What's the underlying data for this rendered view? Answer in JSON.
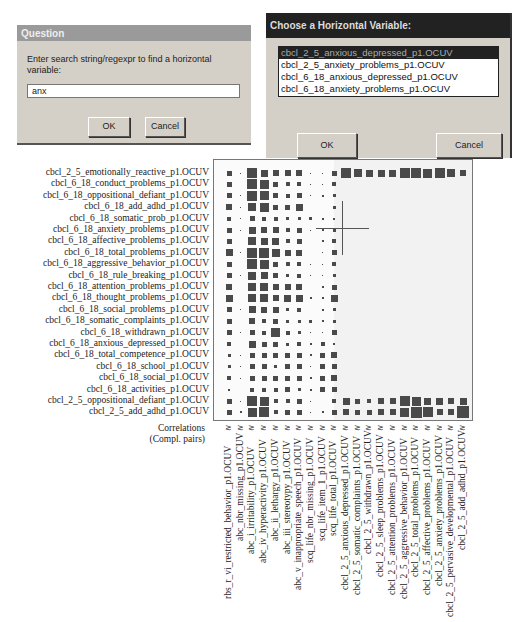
{
  "question_dialog": {
    "title": "Question",
    "prompt": "Enter search string/regexpr to find a horizontal variable:",
    "input_value": "anx",
    "ok_label": "OK",
    "cancel_label": "Cancel"
  },
  "choose_dialog": {
    "title": "Choose a Horizontal Variable:",
    "options": [
      "cbcl_2_5_anxious_depressed_p1.OCUV",
      "cbcl_2_5_anxiety_problems_p1.OCUV",
      "cbcl_6_18_anxious_depressed_p1.OCUV",
      "cbcl_6_18_anxiety_problems_p1.OCUV"
    ],
    "selected_index": 0,
    "ok_label": "OK",
    "cancel_label": "Cancel"
  },
  "matrix": {
    "corner_label_line1": "Correlations",
    "corner_label_line2": "(Compl. pairs)",
    "col_symbol": "≳",
    "row_labels": [
      "cbcl_2_5_emotionally_reactive_p1.OCUV",
      "cbcl_6_18_conduct_problems_p1.OCUV",
      "cbcl_6_18_oppositional_defiant_p1.OCUV",
      "cbcl_6_18_add_adhd_p1.OCUV",
      "cbcl_6_18_somatic_prob_p1.OCUV",
      "cbcl_6_18_anxiety_problems_p1.OCUV",
      "cbcl_6_18_affective_problems_p1.OCUV",
      "cbcl_6_18_total_problems_p1.OCUV",
      "cbcl_6_18_aggressive_behavior_p1.OCUV",
      "cbcl_6_18_rule_breaking_p1.OCUV",
      "cbcl_6_18_attention_problems_p1.OCUV",
      "cbcl_6_18_thought_problems_p1.OCUV",
      "cbcl_6_18_social_problems_p1.OCUV",
      "cbcl_6_18_somatic_complaints_p1.OCUV",
      "cbcl_6_18_withdrawn_p1.OCUV",
      "cbcl_6_18_anxious_depressed_p1.OCUV",
      "cbcl_6_18_total_competence_p1.OCUV",
      "cbcl_6_18_school_p1.OCUV",
      "cbcl_6_18_social_p1.OCUV",
      "cbcl_6_18_activities_p1.OCUV",
      "cbcl_2_5_oppositional_defiant_p1.OCUV",
      "cbcl_2_5_add_adhd_p1.OCUV"
    ],
    "col_labels": [
      "rbs_r_vi_restricted_behavior_p1.OCUV",
      "abc_nbr_missing_p1.OCUV",
      "abc_i_irritability_p1.OCUV",
      "abc_iv_hyperactivity_p1.OCUV",
      "abc_ii_lethargy_p1.OCUV",
      "abc_iii_stereotypy_p1.OCUV",
      "abc_v_inappropriate_speech_p1.OCUV",
      "scq_life_nbr_missing_p1.OCUV",
      "scq_life_item_1_p1.OCUV",
      "scq_life_total_p1.OCUV",
      "cbcl_2_5_anxious_depressed_p1.OCUV",
      "cbcl_2_5_somatic_complaints_p1.OCUV",
      "cbcl_2_5_withdrawn_p1.OCUV",
      "cbcl_2_5_sleep_problems_p1.OCUV",
      "cbcl_2_5_attention_problems_p1.OCUV",
      "cbcl_2_5_aggressive_behavior_p1.OCUV",
      "cbcl_2_5_total_problems_p1.OCUV",
      "cbcl_2_5_affective_problems_p1.OCUV",
      "cbcl_2_5_anxiety_problems_p1.OCUV",
      "cbcl_2_5_pervasive_developmental_p1.OCUV",
      "cbcl_2_5_add_adhd_p1.OCUV"
    ],
    "cell_sizes": [
      [
        5,
        1,
        10,
        7,
        6,
        6,
        6,
        1,
        1,
        5,
        10,
        8,
        7,
        7,
        7,
        10,
        10,
        9,
        10,
        8,
        6
      ],
      [
        5,
        0,
        10,
        9,
        5,
        4,
        4,
        1,
        1,
        4,
        0,
        0,
        0,
        0,
        0,
        0,
        0,
        0,
        0,
        0,
        0
      ],
      [
        5,
        1,
        10,
        9,
        5,
        4,
        5,
        1,
        2,
        3,
        0,
        0,
        0,
        0,
        0,
        0,
        0,
        0,
        0,
        0,
        0
      ],
      [
        6,
        1,
        8,
        9,
        5,
        5,
        7,
        0,
        0,
        3,
        0,
        0,
        0,
        0,
        0,
        0,
        0,
        0,
        0,
        0,
        0
      ],
      [
        4,
        1,
        5,
        4,
        4,
        3,
        3,
        3,
        2,
        2,
        0,
        0,
        0,
        0,
        0,
        0,
        0,
        0,
        0,
        0,
        0
      ],
      [
        5,
        1,
        7,
        6,
        6,
        4,
        5,
        1,
        2,
        3,
        0,
        0,
        0,
        0,
        0,
        0,
        0,
        0,
        0,
        0,
        0
      ],
      [
        5,
        0,
        8,
        7,
        7,
        4,
        5,
        0,
        2,
        4,
        0,
        0,
        0,
        0,
        0,
        0,
        0,
        0,
        0,
        0,
        0
      ],
      [
        7,
        1,
        10,
        10,
        8,
        6,
        6,
        0,
        1,
        5,
        0,
        0,
        0,
        0,
        0,
        0,
        0,
        0,
        0,
        0,
        0
      ],
      [
        5,
        0,
        10,
        9,
        5,
        4,
        4,
        1,
        1,
        4,
        0,
        0,
        0,
        0,
        0,
        0,
        0,
        0,
        0,
        0,
        0
      ],
      [
        5,
        1,
        8,
        7,
        5,
        3,
        4,
        1,
        1,
        3,
        0,
        0,
        0,
        0,
        0,
        0,
        0,
        0,
        0,
        0,
        0
      ],
      [
        6,
        0,
        8,
        8,
        6,
        6,
        6,
        0,
        2,
        5,
        0,
        0,
        0,
        0,
        0,
        0,
        0,
        0,
        0,
        0,
        0
      ],
      [
        7,
        0,
        8,
        8,
        6,
        7,
        7,
        2,
        2,
        7,
        0,
        0,
        0,
        0,
        0,
        0,
        0,
        0,
        0,
        0,
        0
      ],
      [
        5,
        1,
        7,
        6,
        6,
        3,
        4,
        0,
        2,
        3,
        0,
        0,
        0,
        0,
        0,
        0,
        0,
        0,
        0,
        0,
        0
      ],
      [
        5,
        0,
        6,
        4,
        5,
        3,
        3,
        3,
        2,
        3,
        0,
        0,
        0,
        0,
        0,
        0,
        0,
        0,
        0,
        0,
        0
      ],
      [
        5,
        1,
        5,
        4,
        9,
        4,
        3,
        1,
        1,
        5,
        0,
        0,
        0,
        0,
        0,
        0,
        0,
        0,
        0,
        0,
        0
      ],
      [
        4,
        0,
        7,
        5,
        5,
        3,
        4,
        2,
        4,
        2,
        0,
        0,
        0,
        0,
        0,
        0,
        0,
        0,
        0,
        0,
        0
      ],
      [
        3,
        1,
        5,
        5,
        5,
        5,
        5,
        2,
        5,
        6,
        0,
        0,
        0,
        0,
        0,
        0,
        0,
        0,
        0,
        0,
        0
      ],
      [
        3,
        1,
        5,
        5,
        3,
        5,
        5,
        1,
        5,
        5,
        0,
        0,
        0,
        0,
        0,
        0,
        0,
        0,
        0,
        0,
        0
      ],
      [
        4,
        1,
        5,
        5,
        5,
        5,
        5,
        2,
        5,
        6,
        0,
        0,
        0,
        0,
        0,
        0,
        0,
        0,
        0,
        0,
        0
      ],
      [
        2,
        0,
        4,
        4,
        4,
        5,
        3,
        2,
        5,
        5,
        0,
        0,
        0,
        0,
        0,
        0,
        0,
        0,
        0,
        0,
        0
      ],
      [
        5,
        1,
        10,
        9,
        4,
        4,
        5,
        1,
        0,
        4,
        7,
        5,
        4,
        6,
        6,
        10,
        9,
        7,
        7,
        6,
        7
      ],
      [
        5,
        2,
        9,
        10,
        4,
        5,
        5,
        1,
        2,
        5,
        6,
        5,
        5,
        6,
        6,
        9,
        11,
        10,
        6,
        6,
        12
      ]
    ]
  }
}
